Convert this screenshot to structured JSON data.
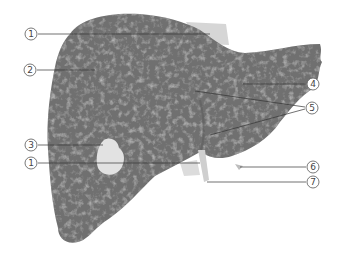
{
  "diagram": {
    "view": "anterior",
    "colors": {
      "liver_base": "#6f6f6f",
      "liver_texture": "#9a9a9a",
      "gallbladder": "#e4e4e4",
      "ligament": "#d4d4d4",
      "leader_line": "#333333",
      "label_ring": "#555555",
      "background": "#ffffff"
    },
    "callouts": [
      {
        "id": "1a",
        "number": "1",
        "glyph": "①",
        "x": 31,
        "y": 34,
        "target": [
          210,
          34
        ]
      },
      {
        "id": "2",
        "number": "2",
        "glyph": "②",
        "x": 30,
        "y": 70,
        "target": [
          95,
          70
        ]
      },
      {
        "id": "3",
        "number": "3",
        "glyph": "③",
        "x": 31,
        "y": 145,
        "target": [
          103,
          145
        ]
      },
      {
        "id": "1b",
        "number": "1",
        "glyph": "①",
        "x": 31,
        "y": 163,
        "target": [
          200,
          163
        ]
      },
      {
        "id": "4",
        "number": "4",
        "glyph": "④",
        "x": 313,
        "y": 84,
        "target": [
          243,
          84
        ]
      },
      {
        "id": "5",
        "number": "5",
        "glyph": "⑤",
        "x": 312,
        "y": 108,
        "targets": [
          [
            195,
            91
          ],
          [
            210,
            135
          ]
        ]
      },
      {
        "id": "6",
        "number": "6",
        "glyph": "⑥",
        "x": 313,
        "y": 167,
        "target": [
          240,
          167
        ]
      },
      {
        "id": "7",
        "number": "7",
        "glyph": "⑦",
        "x": 313,
        "y": 182,
        "target": [
          207,
          182
        ]
      }
    ]
  }
}
